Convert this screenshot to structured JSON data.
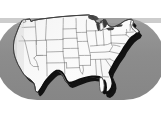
{
  "image": {
    "kind": "illustration",
    "subject": "united-states-map",
    "title": "Map of the contiguous United States",
    "width": 161,
    "height": 115,
    "style": "grayscale clip-art with drop shadow on a gray rounded backdrop"
  },
  "colors": {
    "page_background": "#ffffff",
    "backdrop_shape": "#8c8c8c",
    "backdrop_shape_edge": "#a6a6a6",
    "landmass_fill": "#f7f7f7",
    "landmass_fill_shaded": "#e9e9e9",
    "state_border": "#8a8a8a",
    "country_outline": "#4a4a4a",
    "drop_shadow": "#111111",
    "great_lakes": "#3a3a3a",
    "great_lakes_light": "#5e5e5e"
  },
  "backdrop": {
    "name": "gray-rounded-backdrop",
    "shape": "stadium",
    "x": 0,
    "y": 18,
    "width": 161,
    "height": 82,
    "corner_radius": 41
  },
  "landmass": {
    "name": "contiguous-united-states",
    "label": "Contiguous United States",
    "shadow_offset_x": 3,
    "shadow_offset_y": 4
  },
  "features": [
    {
      "name": "great-lakes",
      "label": "Great Lakes",
      "fill": "#3a3a3a"
    },
    {
      "name": "florida-peninsula",
      "label": "Florida"
    },
    {
      "name": "atlantic-coast",
      "label": "Atlantic Coast"
    },
    {
      "name": "gulf-coast",
      "label": "Gulf Coast"
    },
    {
      "name": "pacific-coast",
      "label": "Pacific Coast"
    },
    {
      "name": "canada-border",
      "label": "Northern Border"
    },
    {
      "name": "mexico-border",
      "label": "Southern Border"
    }
  ],
  "state_borders": {
    "name": "state-boundary-lines",
    "label": "State boundaries",
    "stroke_width": 0.7,
    "visible": true
  }
}
